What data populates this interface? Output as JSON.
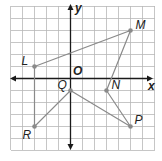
{
  "chart_data": {
    "type": "scatter",
    "title": "",
    "xlabel": "x",
    "ylabel": "y",
    "origin_label": "O",
    "xlim": [
      -5,
      6
    ],
    "ylim": [
      -6,
      6
    ],
    "grid": true,
    "points": [
      {
        "name": "L",
        "x": -3,
        "y": 1
      },
      {
        "name": "M",
        "x": 5,
        "y": 4
      },
      {
        "name": "N",
        "x": 3,
        "y": -1
      },
      {
        "name": "P",
        "x": 5,
        "y": -4
      },
      {
        "name": "Q",
        "x": 0,
        "y": -1
      },
      {
        "name": "R",
        "x": -3,
        "y": -4
      }
    ],
    "polygon_order": [
      "L",
      "M",
      "N",
      "P",
      "Q",
      "R"
    ]
  }
}
